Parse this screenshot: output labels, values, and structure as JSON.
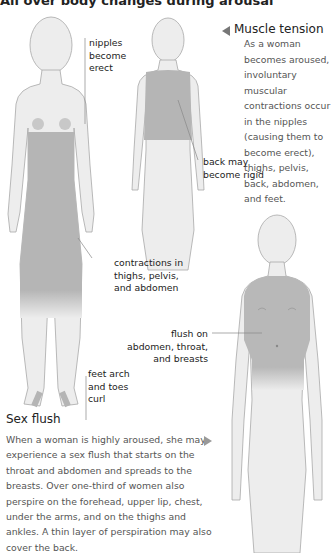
{
  "page": {
    "title": "All over body changes during arousal"
  },
  "muscle_tension": {
    "heading": "Muscle tension",
    "body": "As a woman becomes aroused, involuntary muscular contractions occur in the nipples (causing them to become erect), thighs, pelvis, back, abdomen, and feet."
  },
  "sex_flush": {
    "heading": "Sex flush",
    "body": "When a woman is highly aroused, she may experience a sex flush that starts on the throat and abdomen and spreads to the breasts. Over one-third of women also perspire on the forehead, upper lip, chest, under the arms, and on the thighs and ankles. A thin layer of perspiration may also cover the back."
  },
  "labels": {
    "nipples": [
      "nipples",
      "become",
      "erect"
    ],
    "back": [
      "back may",
      "become rigid"
    ],
    "contractions": [
      "contractions in",
      "thighs, pelvis,",
      "and abdomen"
    ],
    "feet": [
      "feet arch",
      "and toes",
      "curl"
    ],
    "flush": [
      "flush on",
      "abdomen, throat,",
      "and breasts"
    ]
  },
  "colors": {
    "body_fill": "#ededed",
    "body_outline": "#a8a8a8",
    "highlight": "#b5b5b5",
    "pointer": "#888888"
  }
}
